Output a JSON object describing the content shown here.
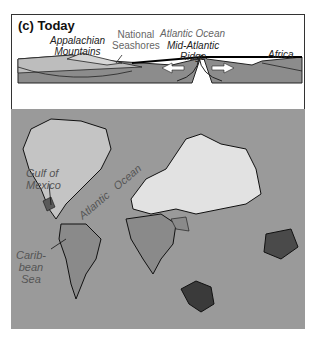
{
  "figure": {
    "panel_title": "(c) Today",
    "cross_section": {
      "labels": {
        "appalachian": "Appalachian Mountains",
        "appalachian_l1": "Appalachian",
        "appalachian_l2": "Mountains",
        "seashores_l1": "National",
        "seashores_l2": "Seashores",
        "ocean": "Atlantic Ocean",
        "ridge_l1": "Mid-Atlantic",
        "ridge_l2": "Ridge",
        "africa": "Africa"
      },
      "arrows": [
        "spreading-left-arrow",
        "spreading-right-arrow"
      ]
    },
    "map": {
      "labels": {
        "gulf_l1": "Gulf of",
        "gulf_l2": "Mexico",
        "atlantic": "Atlantic",
        "ocean": "Ocean",
        "carib_l1": "Carib-",
        "carib_l2": "bean",
        "carib_l3": "Sea"
      },
      "colors": {
        "ocean": "#9a9a9a",
        "north_america": "#c4c4c4",
        "eurasia": "#e2e2e2",
        "africa_south_america": "#8a8a8a",
        "australia_antarctica": "#4a4a4a"
      }
    }
  }
}
